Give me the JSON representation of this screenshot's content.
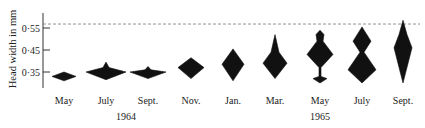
{
  "chart_data": {
    "type": "kite-diagram",
    "title": "",
    "xlabel": "",
    "ylabel": "Head width in mm",
    "ylim": [
      0.3,
      0.6
    ],
    "yticks": [
      {
        "value": 0.55,
        "label": "0·55"
      },
      {
        "value": 0.45,
        "label": "0·45"
      },
      {
        "value": 0.35,
        "label": "0·35"
      }
    ],
    "reference_line": {
      "value": 0.568,
      "style": "dashed"
    },
    "grid": false,
    "legend": null,
    "categories": [
      "May",
      "July",
      "Sept.",
      "Nov.",
      "Jan.",
      "Mar.",
      "May",
      "July",
      "Sept."
    ],
    "year_groups": [
      {
        "label": "1964",
        "months": [
          "May",
          "July",
          "Sept.",
          "Nov."
        ]
      },
      {
        "label": "1965",
        "months": [
          "Jan.",
          "Mar.",
          "May",
          "July",
          "Sept."
        ]
      }
    ],
    "series": [
      {
        "name": "May 1964",
        "x": 64,
        "profile": [
          [
            0.35,
            0
          ],
          [
            0.33,
            12
          ],
          [
            0.31,
            0
          ]
        ],
        "range": [
          0.31,
          0.35
        ]
      },
      {
        "name": "July 1964",
        "x": 106,
        "profile": [
          [
            0.395,
            0
          ],
          [
            0.37,
            3
          ],
          [
            0.35,
            20
          ],
          [
            0.315,
            0
          ]
        ],
        "range": [
          0.315,
          0.395
        ]
      },
      {
        "name": "Sept. 1964",
        "x": 148,
        "profile": [
          [
            0.375,
            0
          ],
          [
            0.36,
            3
          ],
          [
            0.35,
            18
          ],
          [
            0.32,
            0
          ]
        ],
        "range": [
          0.32,
          0.375
        ]
      },
      {
        "name": "Nov. 1964",
        "x": 191,
        "profile": [
          [
            0.415,
            0
          ],
          [
            0.37,
            13
          ],
          [
            0.32,
            0
          ]
        ],
        "range": [
          0.32,
          0.415
        ]
      },
      {
        "name": "Jan. 1965",
        "x": 233,
        "profile": [
          [
            0.455,
            0
          ],
          [
            0.385,
            11
          ],
          [
            0.31,
            0
          ]
        ],
        "range": [
          0.31,
          0.455
        ]
      },
      {
        "name": "Mar. 1965",
        "x": 275,
        "profile": [
          [
            0.52,
            0
          ],
          [
            0.44,
            4
          ],
          [
            0.39,
            12
          ],
          [
            0.32,
            0
          ]
        ],
        "range": [
          0.32,
          0.52
        ]
      },
      {
        "name": "May 1965",
        "x": 320,
        "profile": [
          [
            0.54,
            0
          ],
          [
            0.52,
            4
          ],
          [
            0.49,
            3
          ],
          [
            0.43,
            13
          ],
          [
            0.37,
            1
          ],
          [
            0.33,
            1
          ],
          [
            0.32,
            7
          ],
          [
            0.3,
            0
          ]
        ],
        "range": [
          0.3,
          0.54
        ]
      },
      {
        "name": "July 1965",
        "x": 362,
        "profile": [
          [
            0.555,
            0
          ],
          [
            0.49,
            9
          ],
          [
            0.44,
            2
          ],
          [
            0.36,
            14
          ],
          [
            0.3,
            0
          ]
        ],
        "range": [
          0.3,
          0.555
        ]
      },
      {
        "name": "Sept. 1965",
        "x": 403,
        "profile": [
          [
            0.585,
            0
          ],
          [
            0.52,
            4
          ],
          [
            0.46,
            9
          ],
          [
            0.3,
            0
          ]
        ],
        "range": [
          0.3,
          0.585
        ]
      }
    ]
  },
  "axis": {
    "ylabel": "Head width in mm",
    "ticks": [
      "0·55",
      "0·45",
      "0·35"
    ]
  },
  "xaxis": {
    "months": [
      "May",
      "July",
      "Sept.",
      "Nov.",
      "Jan.",
      "Mar.",
      "May",
      "July",
      "Sept."
    ],
    "years": [
      "1964",
      "1965"
    ]
  }
}
